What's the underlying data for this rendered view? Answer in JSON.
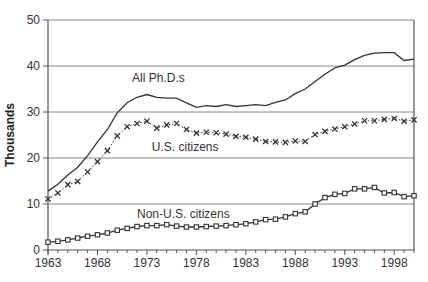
{
  "chart_data": {
    "type": "line",
    "title": "",
    "xlabel": "",
    "ylabel": "Thousands",
    "ylim": [
      0,
      50
    ],
    "xlim": [
      1963,
      2000
    ],
    "yticks": [
      0,
      10,
      20,
      30,
      40,
      50
    ],
    "xticks": [
      1963,
      1968,
      1973,
      1978,
      1983,
      1988,
      1993,
      1998
    ],
    "grid": "horizontal",
    "legend": "inline labels",
    "x": [
      1963,
      1964,
      1965,
      1966,
      1967,
      1968,
      1969,
      1970,
      1971,
      1972,
      1973,
      1974,
      1975,
      1976,
      1977,
      1978,
      1979,
      1980,
      1981,
      1982,
      1983,
      1984,
      1985,
      1986,
      1987,
      1988,
      1989,
      1990,
      1991,
      1992,
      1993,
      1994,
      1995,
      1996,
      1997,
      1998,
      1999,
      2000
    ],
    "series": [
      {
        "name": "All Ph.D.s",
        "marker": "none",
        "style": "solid",
        "values": [
          12.8,
          14.3,
          16.3,
          18.0,
          20.5,
          23.5,
          26.2,
          29.8,
          32.0,
          33.2,
          33.8,
          33.2,
          33.0,
          33.0,
          32.0,
          31.0,
          31.4,
          31.2,
          31.6,
          31.2,
          31.4,
          31.6,
          31.4,
          32.1,
          32.6,
          34.0,
          35.0,
          36.6,
          38.2,
          39.6,
          40.2,
          41.4,
          42.3,
          42.8,
          42.9,
          42.9,
          41.2,
          41.5
        ]
      },
      {
        "name": "U.S. citizens",
        "marker": "x",
        "style": "dotted",
        "values": [
          11.1,
          12.4,
          14.2,
          14.9,
          17.0,
          19.2,
          21.6,
          24.8,
          26.8,
          27.5,
          28.0,
          26.5,
          27.2,
          27.5,
          26.2,
          25.4,
          25.6,
          25.5,
          25.2,
          24.7,
          24.5,
          24.1,
          23.6,
          23.5,
          23.4,
          23.7,
          23.6,
          25.1,
          25.8,
          26.3,
          26.8,
          27.4,
          28.1,
          28.1,
          28.4,
          28.6,
          28.0,
          28.3
        ]
      },
      {
        "name": "Non-U.S. citizens",
        "marker": "square",
        "style": "solid",
        "values": [
          1.7,
          1.9,
          2.2,
          2.6,
          3.0,
          3.3,
          3.7,
          4.3,
          4.7,
          5.1,
          5.3,
          5.3,
          5.5,
          5.2,
          5.0,
          5.0,
          5.1,
          5.2,
          5.3,
          5.5,
          5.7,
          6.1,
          6.6,
          6.7,
          7.2,
          7.9,
          8.3,
          10.0,
          11.4,
          12.1,
          12.3,
          13.3,
          13.3,
          13.6,
          12.4,
          12.5,
          11.6,
          11.8
        ]
      }
    ],
    "annotations": [
      {
        "text": "All Ph.D.s",
        "x": 1971.5,
        "y": 36.5
      },
      {
        "text": "U.S. citizens",
        "x": 1973.5,
        "y": 21.5
      },
      {
        "text": "Non-U.S. citizens",
        "x": 1972,
        "y": 7
      }
    ]
  },
  "colors": {
    "line": "#333333",
    "grid": "#8a8a8a",
    "axis": "#555555"
  }
}
